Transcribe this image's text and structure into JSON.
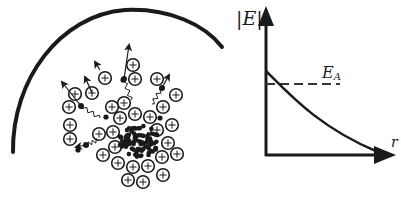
{
  "left_panel": {
    "description": "Positive ion cloud with dense electron core; electrons escaping along wavy paths toward a curved boundary",
    "ion_symbol": "+",
    "ion_count": 31,
    "escaping_electrons": 6
  },
  "right_panel": {
    "y_axis_label": "|E|",
    "x_axis_label": "r",
    "threshold_label": "E",
    "threshold_subscript": "A",
    "curve": "monotonically decreasing field magnitude vs r",
    "threshold_relative_level": 0.62
  },
  "colors": {
    "ink": "#1a1a1a",
    "dash": "#333333",
    "background": "#ffffff"
  }
}
